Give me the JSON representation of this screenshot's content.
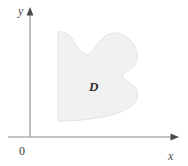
{
  "figure": {
    "type": "math-region-diagram",
    "background_color": "#ffffff",
    "axes": {
      "x_axis_label": "x",
      "y_axis_label": "y",
      "origin_label": "0",
      "axis_color": "#8a8a8a",
      "arrowhead_color": "#4a4a4a",
      "origin_x": 30,
      "origin_y": 137
    },
    "region": {
      "label": "D",
      "fill_color": "#f1f1f1",
      "stroke_color": "#e2e2e2",
      "label_x": 95,
      "label_y": 86,
      "description": "Closed curved region with a concave notch at the top, a concave notch on the right side, a straight vertical left edge and a concave-up bottom edge"
    }
  }
}
